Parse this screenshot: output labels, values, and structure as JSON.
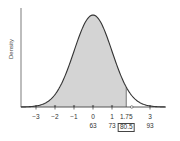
{
  "chart_data": {
    "type": "area",
    "title": "",
    "xlabel": "",
    "ylabel": "Density",
    "distribution": "normal",
    "mean": 0,
    "sd": 1,
    "raw_mean": 63,
    "raw_sd": 10,
    "shaded_region": {
      "from": "-inf",
      "to": 1.75,
      "raw_to": 80.5
    },
    "z_ticks": [
      "-3",
      "-2",
      "-1",
      "0",
      "1",
      "1.75",
      "3"
    ],
    "raw_tick_labels": [
      {
        "z": "0",
        "raw": "63"
      },
      {
        "z": "1",
        "raw": "73"
      },
      {
        "z": "1.75",
        "raw": "80.5",
        "boxed": true
      },
      {
        "z": "3",
        "raw": "93"
      }
    ],
    "xlim": [
      -3.8,
      3.8
    ],
    "grid": false,
    "legend": null,
    "colors": {
      "curve": "#333333",
      "fill": "#d4d4d4",
      "axis": "#444444"
    }
  },
  "axis": {
    "ylabel": "Density",
    "ticks": [
      {
        "z": -3,
        "label": "−3"
      },
      {
        "z": -2,
        "label": "−2"
      },
      {
        "z": -1,
        "label": "−1"
      },
      {
        "z": 0,
        "label": "0",
        "raw": "63"
      },
      {
        "z": 1,
        "label": "1",
        "raw": "73"
      },
      {
        "z": 1.75,
        "label": "1.75",
        "raw": "80.5",
        "boxed": true
      },
      {
        "z": 3,
        "label": "3",
        "raw": "93"
      }
    ]
  }
}
